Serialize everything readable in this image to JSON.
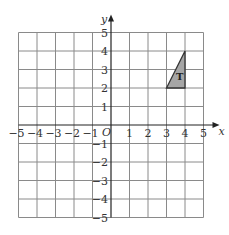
{
  "figure": {
    "type": "coordinate-grid",
    "x_axis_label": "x",
    "y_axis_label": "y",
    "origin_label": "O",
    "x_range": [
      -5,
      5
    ],
    "y_range": [
      -5,
      5
    ],
    "x_tick_labels": [
      "-5",
      "-4",
      "-3",
      "-2",
      "-1",
      "1",
      "2",
      "3",
      "4",
      "5"
    ],
    "y_tick_labels": [
      "5",
      "4",
      "3",
      "2",
      "1",
      "-1",
      "-2",
      "-3",
      "-4",
      "-5"
    ],
    "grid_color": "#8a8a8a",
    "axis_color": "#222222"
  },
  "shapes": [
    {
      "label": "T",
      "type": "triangle",
      "vertices": [
        [
          3,
          2
        ],
        [
          4,
          2
        ],
        [
          4,
          4
        ]
      ],
      "fill": "#a6a6a6",
      "stroke": "#333333"
    }
  ]
}
